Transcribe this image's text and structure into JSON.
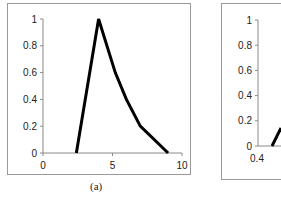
{
  "chart_data": [
    {
      "type": "line",
      "panel": "(a)",
      "title": "",
      "xlabel": "",
      "ylabel": "",
      "xlim": [
        0,
        10
      ],
      "ylim": [
        0,
        1
      ],
      "x_ticks": [
        "0",
        "5",
        "10"
      ],
      "y_ticks": [
        "0",
        "0.2",
        "0.4",
        "0.6",
        "0.8",
        "1"
      ],
      "grid": false,
      "series": [
        {
          "name": "membership",
          "color": "#000000",
          "x": [
            2.4,
            4.0,
            5.2,
            6.0,
            7.0,
            9.0
          ],
          "y": [
            0,
            1.0,
            0.6,
            0.4,
            0.2,
            0
          ]
        }
      ]
    },
    {
      "type": "line",
      "panel": "(b)",
      "partial": true,
      "ylim": [
        0,
        1
      ],
      "y_ticks": [
        "0",
        "0.2",
        "0.4",
        "0.6",
        "0.8",
        "1"
      ],
      "x_ticks": [
        "0.4"
      ],
      "series": []
    }
  ],
  "captions": {
    "a": "(a)"
  }
}
